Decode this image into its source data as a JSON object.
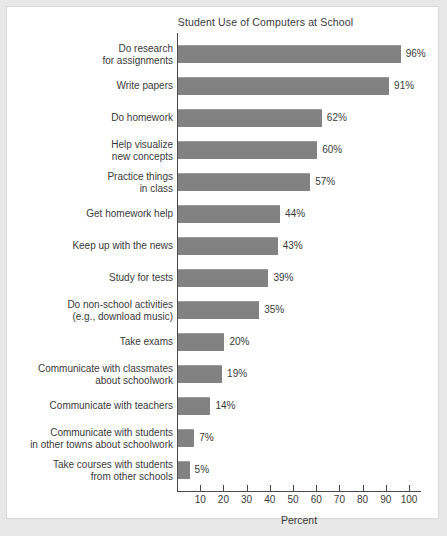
{
  "figure": {
    "background_color": "#e8e8e8",
    "panel_color": "#ffffff",
    "bar_color": "#828282",
    "text_color": "#3a3a3a"
  },
  "chart_data": {
    "type": "bar",
    "orientation": "horizontal",
    "title": "Student Use of Computers at School",
    "xlabel": "Percent",
    "ylabel": "",
    "xlim": [
      0,
      100
    ],
    "xticks": [
      10,
      20,
      30,
      40,
      50,
      60,
      70,
      80,
      90,
      100
    ],
    "grid": false,
    "legend": null,
    "value_suffix": "%",
    "categories": [
      "Do research\nfor assignments",
      "Write papers",
      "Do homework",
      "Help visualize\nnew concepts",
      "Practice things\nin class",
      "Get homework help",
      "Keep up with the news",
      "Study for tests",
      "Do non-school activities\n(e.g., download music)",
      "Take exams",
      "Communicate with classmates\nabout schoolwork",
      "Communicate with teachers",
      "Communicate with students\nin other towns about schoolwork",
      "Take courses with students\nfrom other schools"
    ],
    "values": [
      96,
      91,
      62,
      60,
      57,
      44,
      43,
      39,
      35,
      20,
      19,
      14,
      7,
      5
    ],
    "value_labels": [
      "96%",
      "91%",
      "62%",
      "60%",
      "57%",
      "44%",
      "43%",
      "39%",
      "35%",
      "20%",
      "19%",
      "14%",
      "7%",
      "5%"
    ],
    "tick_labels": [
      "10",
      "20",
      "30",
      "40",
      "50",
      "60",
      "70",
      "80",
      "90",
      "100"
    ]
  }
}
